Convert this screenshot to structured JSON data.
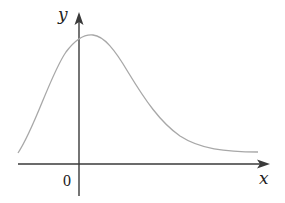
{
  "figure": {
    "x_axis_label": "x",
    "y_axis_label": "y",
    "origin_label": "0",
    "colors": {
      "axis": "#3a3a3a",
      "curve": "#a8a8a8",
      "text": "#222222",
      "background": "#ffffff"
    }
  },
  "curve": {
    "description": "right-skewed unimodal bell-shaped curve, peak slightly right of the y-axis, left end rises from near the x-axis, right tail decays toward a horizontal asymptote above the x-axis",
    "path": "M18,153 C35,128 50,75 66,52 C75,40 84,34 93,35 C104,36 115,50 128,72 C145,100 160,122 180,136 C200,149 225,152 258,152"
  }
}
